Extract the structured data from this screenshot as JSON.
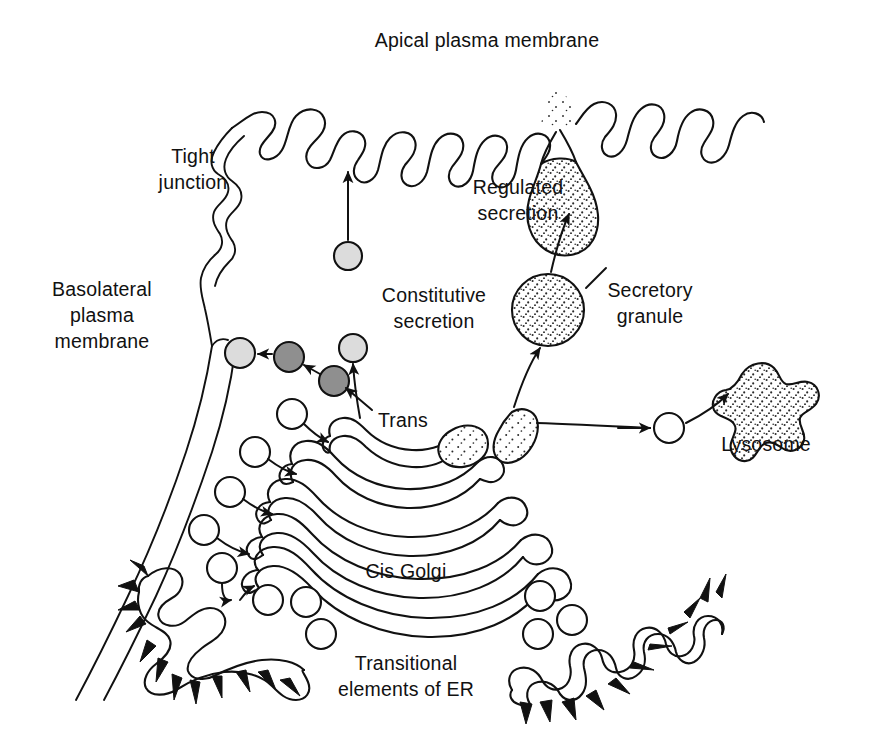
{
  "figure": {
    "background_color": "#ffffff",
    "ink_color": "#111111"
  },
  "labels": {
    "apical_membrane": "Apical plasma membrane",
    "tight_junction": "Tight junction",
    "tight_junction_line1": "Tight",
    "tight_junction_line2": "junction",
    "basolateral_line1": "Basolateral",
    "basolateral_line2": "plasma",
    "basolateral_line3": "membrane",
    "constitutive_line1": "Constitutive",
    "constitutive_line2": "secretion",
    "regulated_line1": "Regulated",
    "regulated_line2": "secretion",
    "secretory_granule_line1": "Secretory",
    "secretory_granule_line2": "granule",
    "lysosome": "Lysosome",
    "trans": "Trans",
    "cis_golgi": "Cis Golgi",
    "er_line1": "Transitional",
    "er_line2": "elements of ER"
  },
  "structures": [
    {
      "name": "apical-plasma-membrane",
      "kind": "membrane",
      "note": "wavy microvillar folds across top of cell"
    },
    {
      "name": "tight-junction",
      "kind": "membrane-junction",
      "note": "interlocked wavy double line at upper left"
    },
    {
      "name": "basolateral-plasma-membrane",
      "kind": "membrane",
      "note": "double line running down-left"
    },
    {
      "name": "golgi-stack",
      "kind": "organelle",
      "cisternae": 5,
      "note": "curved cisternae with dilated bulbous rims"
    },
    {
      "name": "trans-golgi-network",
      "kind": "organelle-region",
      "note": "stippled budding regions at trans face"
    },
    {
      "name": "cis-golgi-face",
      "kind": "organelle-region"
    },
    {
      "name": "rough-er-left",
      "kind": "organelle",
      "note": "transitional ER with ribosome spikes"
    },
    {
      "name": "rough-er-right",
      "kind": "organelle",
      "note": "transitional ER with ribosome spikes"
    },
    {
      "name": "secretory-granule",
      "kind": "vesicle",
      "fill": "stippled"
    },
    {
      "name": "regulated-secretion-granule-fusing",
      "kind": "vesicle",
      "fill": "stippled",
      "note": "exocytosing at apical membrane"
    },
    {
      "name": "lysosome",
      "kind": "organelle",
      "fill": "stippled",
      "note": "irregular lobed blob"
    },
    {
      "name": "constitutive-vesicle-apical",
      "kind": "vesicle",
      "fill": "#dcdcdc"
    },
    {
      "name": "basolateral-vesicle-fusing",
      "kind": "vesicle",
      "fill": "#dcdcdc"
    },
    {
      "name": "basolateral-vesicle-1",
      "kind": "vesicle",
      "fill": "#8f8f8f"
    },
    {
      "name": "basolateral-vesicle-2",
      "kind": "vesicle",
      "fill": "#8f8f8f"
    },
    {
      "name": "er-to-golgi-vesicles",
      "kind": "vesicle-group",
      "count": 8,
      "fill": "#ffffff"
    }
  ],
  "pathways": [
    {
      "name": "constitutive-secretion-arrow",
      "from": "trans-golgi-network",
      "to": "apical-plasma-membrane"
    },
    {
      "name": "regulated-secretion-arrow",
      "from": "secretory-granule",
      "to": "apical-plasma-membrane"
    },
    {
      "name": "granule-formation-arrow",
      "from": "trans-golgi-network",
      "to": "secretory-granule"
    },
    {
      "name": "basolateral-transport-arrows",
      "from": "trans-golgi-network",
      "to": "basolateral-plasma-membrane"
    },
    {
      "name": "lysosome-delivery-arrow",
      "from": "trans-golgi-network",
      "to": "lysosome"
    },
    {
      "name": "er-to-cis-golgi-arrows",
      "from": "transitional-elements-of-er",
      "to": "cis-golgi-face"
    }
  ],
  "vesicle_colors": {
    "clear": "#ffffff",
    "light_gray": "#dcdcdc",
    "dark_gray": "#8f8f8f"
  }
}
